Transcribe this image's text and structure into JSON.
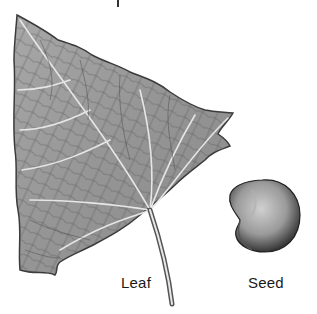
{
  "figure": {
    "labels": {
      "leaf": "Leaf",
      "seed": "Seed"
    },
    "colors": {
      "background": "#ffffff",
      "leaf_fill": "#9a9a9a",
      "leaf_outline": "#3a3a3a",
      "vein": "#e8e8e8",
      "seed_dark": "#2a2a2a",
      "seed_light": "#c8c8c8",
      "text": "#1a1a1a"
    }
  }
}
